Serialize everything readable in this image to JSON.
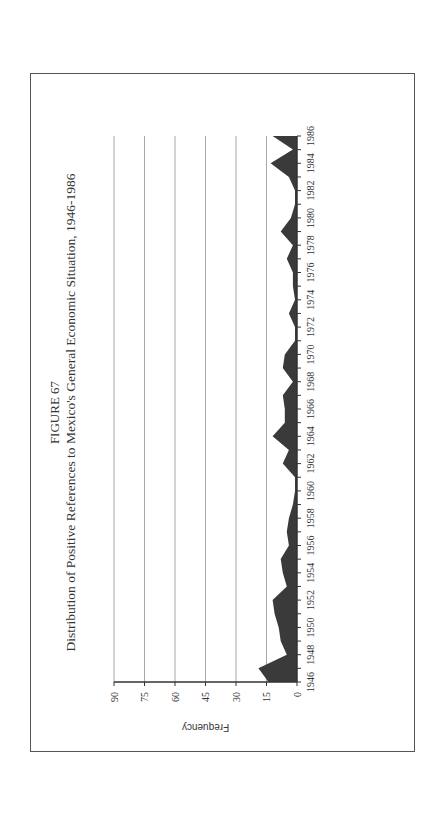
{
  "figure": {
    "label": "FIGURE 67",
    "title": "Distribution of Positive References to Mexico's General Economic Situation, 1946-1986"
  },
  "colors": {
    "area_fill": "#3a3a3a",
    "gridline": "#a8a8a8",
    "axis": "#333333",
    "border": "#555555"
  },
  "chart_data": {
    "type": "area",
    "title": "Distribution of Positive References to Mexico's General Economic Situation, 1946-1986",
    "subtitle": "FIGURE 67",
    "xlabel": "",
    "ylabel": "Frequency",
    "ylim": [
      0,
      90
    ],
    "yticks": [
      0,
      15,
      30,
      45,
      60,
      75,
      90
    ],
    "xlim": [
      1946,
      1986
    ],
    "xtick_labels": [
      "1946",
      "1948",
      "1950",
      "1952",
      "1954",
      "1956",
      "1958",
      "1960",
      "1962",
      "1964",
      "1966",
      "1968",
      "1970",
      "1972",
      "1974",
      "1976",
      "1978",
      "1980",
      "1982",
      "1984",
      "1986"
    ],
    "grid": true,
    "legend": null,
    "orientation_note": "page rotated 90 degrees counter-clockwise",
    "x": [
      1946,
      1947,
      1948,
      1949,
      1950,
      1951,
      1952,
      1953,
      1954,
      1955,
      1956,
      1957,
      1958,
      1959,
      1960,
      1961,
      1962,
      1963,
      1964,
      1965,
      1966,
      1967,
      1968,
      1969,
      1970,
      1971,
      1972,
      1973,
      1974,
      1975,
      1976,
      1977,
      1978,
      1979,
      1980,
      1981,
      1982,
      1983,
      1984,
      1985,
      1986
    ],
    "values": [
      14,
      19,
      5,
      8,
      9,
      11,
      12,
      5,
      7,
      8,
      4,
      5,
      4,
      2,
      1,
      1,
      7,
      4,
      12,
      6,
      6,
      7,
      2,
      7,
      6,
      1,
      1,
      4,
      1,
      2,
      2,
      5,
      2,
      8,
      3,
      1,
      1,
      4,
      13,
      2,
      12
    ]
  }
}
